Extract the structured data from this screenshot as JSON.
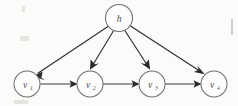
{
  "figure": {
    "kind": "directed-graphical-model",
    "background_color": "#fcfbfa",
    "stroke_color": "#2e2e2e",
    "node_stroke_color": "#6f6f6f",
    "node_fill_color": "#fdfdfc",
    "label_color": "#4a4a4a",
    "margin_mark_color": "#cfcfcf"
  },
  "nodes": {
    "hidden": {
      "id": "h",
      "label": "h",
      "subscript": "",
      "cx": 119,
      "cy": 18,
      "r": 13.5
    },
    "observed": [
      {
        "id": "v1",
        "label": "v",
        "subscript": "1",
        "cx": 27,
        "cy": 84,
        "r": 13.0
      },
      {
        "id": "v2",
        "label": "v",
        "subscript": "2",
        "cx": 90,
        "cy": 84,
        "r": 13.0
      },
      {
        "id": "v3",
        "label": "v",
        "subscript": "3",
        "cx": 152,
        "cy": 84,
        "r": 13.0
      },
      {
        "id": "v4",
        "label": "v",
        "subscript": "4",
        "cx": 214,
        "cy": 84,
        "r": 13.0
      }
    ]
  },
  "edges": [
    {
      "id": "h-v1",
      "from": "h",
      "to": "v1",
      "type": "directed"
    },
    {
      "id": "h-v2",
      "from": "h",
      "to": "v2",
      "type": "directed"
    },
    {
      "id": "h-v3",
      "from": "h",
      "to": "v3",
      "type": "directed"
    },
    {
      "id": "h-v4",
      "from": "h",
      "to": "v4",
      "type": "directed"
    },
    {
      "id": "v1-v2",
      "from": "v1",
      "to": "v2",
      "type": "directed"
    },
    {
      "id": "v2-v3",
      "from": "v2",
      "to": "v3",
      "type": "directed"
    },
    {
      "id": "v3-v4",
      "from": "v3",
      "to": "v4",
      "type": "directed"
    }
  ],
  "margin": {
    "mark_present": true,
    "mark_x": 231,
    "mark_y": 19,
    "mark_width": 2,
    "mark_height": 16
  }
}
